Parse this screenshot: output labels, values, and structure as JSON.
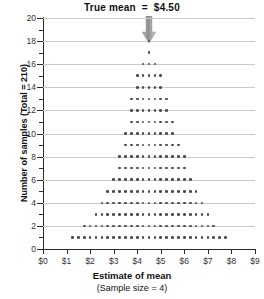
{
  "chart_data": {
    "type": "bar",
    "title": "True mean  =  $4.50",
    "xlabel": "Estimate of mean",
    "xsublabel": "(Sample size = 4)",
    "ylabel": "Number of samples (Total = 210)",
    "xlim": [
      0,
      9
    ],
    "ylim": [
      0,
      20
    ],
    "xticks": [
      0,
      1,
      2,
      3,
      4,
      5,
      6,
      7,
      8,
      9
    ],
    "xticklabels": [
      "$0",
      "$1",
      "$2",
      "$3",
      "$4",
      "$5",
      "$6",
      "$7",
      "$8",
      "$9"
    ],
    "yticks": [
      0,
      2,
      4,
      6,
      8,
      10,
      12,
      14,
      16,
      18,
      20
    ],
    "yticklabels": [
      "0",
      "2",
      "4",
      "6",
      "8",
      "10",
      "12",
      "14",
      "16",
      "18",
      "20"
    ],
    "yticks_minor": [
      1,
      3,
      5,
      7,
      9,
      11,
      13,
      15,
      17,
      19
    ],
    "grid": "horizontal",
    "legend": "none",
    "annotation": {
      "label": "True mean  =  $4.50",
      "value": 4.5,
      "marker": "down-arrow",
      "color": "#9a9a9a"
    },
    "dot_size": 2.6,
    "dot_color": "#4a4a55",
    "bin_width": 0.25,
    "categories": [
      "1.25",
      "1.50",
      "1.75",
      "2.00",
      "2.25",
      "2.50",
      "2.75",
      "3.00",
      "3.25",
      "3.50",
      "3.75",
      "4.00",
      "4.25",
      "4.50",
      "4.75",
      "5.00",
      "5.25",
      "5.50",
      "5.75",
      "6.00",
      "6.25",
      "6.50",
      "6.75",
      "7.00",
      "7.25",
      "7.50",
      "7.75"
    ],
    "values": [
      1,
      1,
      2,
      2,
      3,
      4,
      5,
      6,
      8,
      10,
      13,
      15,
      16,
      18,
      16,
      15,
      13,
      11,
      9,
      8,
      6,
      5,
      4,
      3,
      2,
      1,
      1
    ],
    "total": 210
  }
}
